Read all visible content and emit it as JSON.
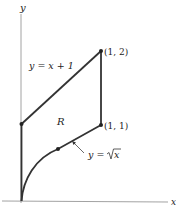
{
  "figure": {
    "axes": {
      "x_label": "x",
      "y_label": "y"
    },
    "curves": {
      "upper": {
        "label": "y = x + 1",
        "equation": "y = x + 1"
      },
      "lower": {
        "label_prefix": "y = ",
        "label_radicand": "x",
        "equation": "y = sqrt(x)"
      }
    },
    "region_label": "R",
    "points": [
      {
        "label": "(1, 2)",
        "x": 1,
        "y": 2
      },
      {
        "label": "(1, 1)",
        "x": 1,
        "y": 1
      },
      {
        "label": "",
        "x": 0,
        "y": 1
      },
      {
        "label": "",
        "x": 0.25,
        "y": 0.5
      }
    ],
    "colors": {
      "stroke": "#333333",
      "axis": "#888888",
      "text": "#222222"
    }
  }
}
